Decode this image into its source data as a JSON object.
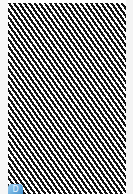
{
  "canvas": {
    "pattern": "diagonal-stripes",
    "stripe_colors": [
      "#111111",
      "#ffffff"
    ]
  },
  "taskbar": {
    "app_icon": {
      "name": "app-icon",
      "color": "#3b8ccc",
      "glyph": "D"
    }
  }
}
